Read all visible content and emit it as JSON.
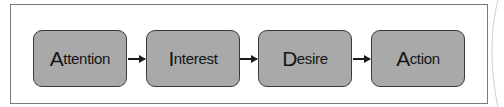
{
  "diagram": {
    "stages": [
      {
        "initial": "A",
        "rest": "ttention",
        "label": "Attention"
      },
      {
        "initial": "I",
        "rest": "nterest",
        "label": "Interest"
      },
      {
        "initial": "D",
        "rest": "esire",
        "label": "Desire"
      },
      {
        "initial": "A",
        "rest": "ction",
        "label": "Action"
      }
    ],
    "connectors": [
      {
        "from": "Attention",
        "to": "Interest"
      },
      {
        "from": "Interest",
        "to": "Desire"
      },
      {
        "from": "Desire",
        "to": "Action"
      }
    ],
    "colors": {
      "box_fill": "#a9a9a9",
      "box_border": "#3a3a3a",
      "arrow": "#1c1c1c",
      "frame_border": "#7a7a7a"
    }
  }
}
